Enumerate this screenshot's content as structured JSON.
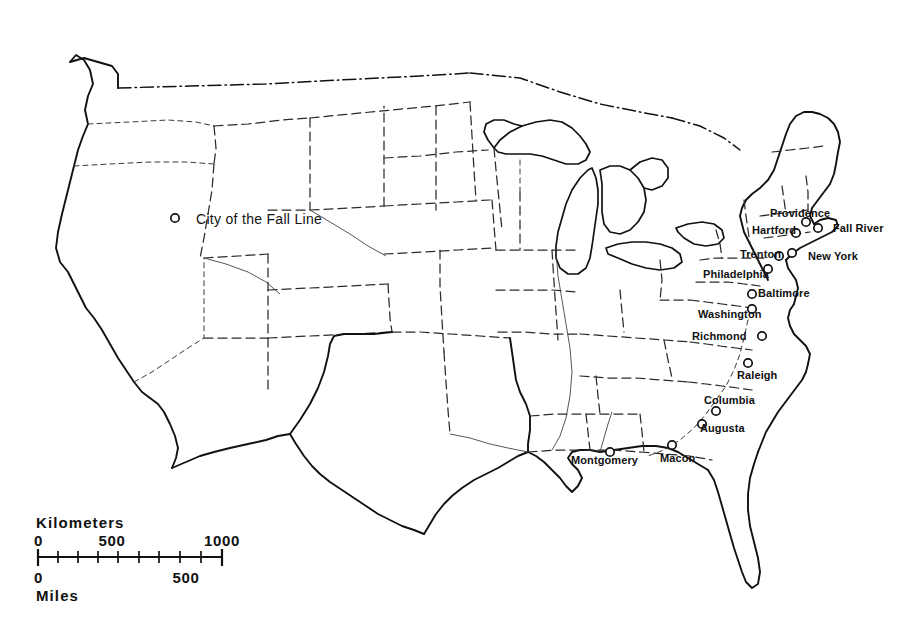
{
  "map": {
    "title": "Cities of the Fall Line — Eastern United States",
    "legend": {
      "marker_icon": "open-circle-marker",
      "label": "City of the Fall Line"
    },
    "scale": {
      "kilometers_title": "Kilometers",
      "miles_title": "Miles",
      "km_ticks": [
        "0",
        "500",
        "1000"
      ],
      "mile_ticks": [
        "0",
        "500"
      ]
    },
    "cities": [
      {
        "name": "Providence",
        "label_x": 770,
        "label_y": 217,
        "dot_x": 806,
        "dot_y": 222,
        "anchor": "start"
      },
      {
        "name": "Hartford",
        "label_x": 752,
        "label_y": 234,
        "dot_x": 796,
        "dot_y": 233,
        "anchor": "start"
      },
      {
        "name": "Fall River",
        "label_x": 833,
        "label_y": 232,
        "dot_x": 818,
        "dot_y": 228,
        "anchor": "start"
      },
      {
        "name": "Trenton",
        "label_x": 740,
        "label_y": 258,
        "dot_x": 779,
        "dot_y": 256,
        "anchor": "start"
      },
      {
        "name": "New York",
        "label_x": 808,
        "label_y": 260,
        "dot_x": 792,
        "dot_y": 253,
        "anchor": "start"
      },
      {
        "name": "Philadelphia",
        "label_x": 703,
        "label_y": 278,
        "dot_x": 768,
        "dot_y": 269,
        "anchor": "start"
      },
      {
        "name": "Baltimore",
        "label_x": 758,
        "label_y": 297,
        "dot_x": 752,
        "dot_y": 294,
        "anchor": "start"
      },
      {
        "name": "Washington",
        "label_x": 698,
        "label_y": 318,
        "dot_x": 752,
        "dot_y": 309,
        "anchor": "start"
      },
      {
        "name": "Richmond",
        "label_x": 692,
        "label_y": 340,
        "dot_x": 762,
        "dot_y": 336,
        "anchor": "start"
      },
      {
        "name": "Raleigh",
        "label_x": 737,
        "label_y": 379,
        "dot_x": 748,
        "dot_y": 363,
        "anchor": "start"
      },
      {
        "name": "Columbia",
        "label_x": 704,
        "label_y": 404,
        "dot_x": 716,
        "dot_y": 411,
        "anchor": "start"
      },
      {
        "name": "Augusta",
        "label_x": 700,
        "label_y": 432,
        "dot_x": 702,
        "dot_y": 424,
        "anchor": "start"
      },
      {
        "name": "Macon",
        "label_x": 660,
        "label_y": 462,
        "dot_x": 672,
        "dot_y": 445,
        "anchor": "start"
      },
      {
        "name": "Montgomery",
        "label_x": 571,
        "label_y": 464,
        "dot_x": 610,
        "dot_y": 452,
        "anchor": "start"
      }
    ]
  }
}
